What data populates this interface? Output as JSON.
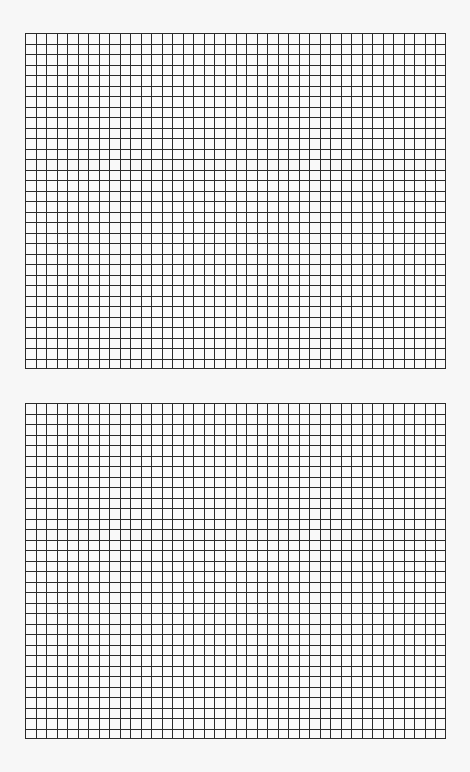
{
  "page": {
    "background": "#f7f7f7",
    "line_color": "#2a2a2a"
  },
  "grids": [
    {
      "name": "top-grid",
      "x": 25,
      "y": 33,
      "width": 421,
      "height": 336,
      "columns": 40,
      "rows": 32
    },
    {
      "name": "bottom-grid",
      "x": 25,
      "y": 403,
      "width": 421,
      "height": 336,
      "columns": 40,
      "rows": 32
    }
  ]
}
